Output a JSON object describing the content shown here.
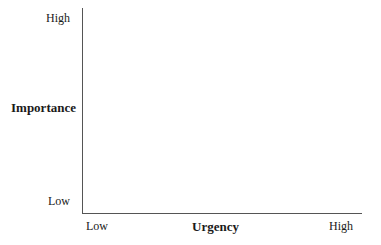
{
  "chart_data": {
    "type": "scatter",
    "title": "",
    "xlabel": "Urgency",
    "ylabel": "Importance",
    "x_ticks": [
      "Low",
      "High"
    ],
    "y_ticks": [
      "Low",
      "High"
    ],
    "xlim": [
      "Low",
      "High"
    ],
    "ylim": [
      "Low",
      "High"
    ],
    "grid": false,
    "legend": null,
    "series": []
  },
  "axes": {
    "y": {
      "high_label": "High",
      "low_label": "Low",
      "title": "Importance"
    },
    "x": {
      "low_label": "Low",
      "high_label": "High",
      "title": "Urgency"
    }
  }
}
